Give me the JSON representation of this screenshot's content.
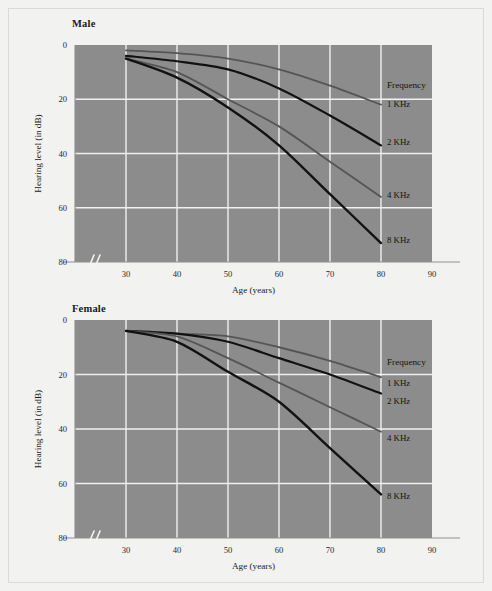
{
  "figure": {
    "background_color": "#f2f2f0",
    "plot_background_color": "#8c8c8c",
    "grid_color": "#f0f0ee"
  },
  "panels": [
    {
      "id": "male",
      "title": "Male",
      "legend_title": "Frequency",
      "xlabel": "Age (years)",
      "ylabel": "Hearing level (in dB)"
    },
    {
      "id": "female",
      "title": "Female",
      "legend_title": "Frequency",
      "xlabel": "Age (years)",
      "ylabel": "Hearing level (in dB)"
    }
  ],
  "axis": {
    "x_ticks": [
      "30",
      "40",
      "50",
      "60",
      "70",
      "80",
      "90"
    ],
    "y_ticks": [
      "0",
      "20",
      "40",
      "60",
      "80"
    ],
    "x_break_marker": "//"
  },
  "legend_labels": [
    "1 KHz",
    "2 KHz",
    "4 KHz",
    "8 KHz"
  ],
  "chart_data": [
    {
      "type": "line",
      "title": "Male",
      "xlabel": "Age (years)",
      "ylabel": "Hearing level (in dB)",
      "xlim": [
        20,
        90
      ],
      "ylim": [
        0,
        80
      ],
      "y_inverted": true,
      "xticks": [
        30,
        40,
        50,
        60,
        70,
        80,
        90
      ],
      "yticks": [
        0,
        20,
        40,
        60,
        80
      ],
      "grid": true,
      "legend_title": "Frequency",
      "legend_position": "right-outside",
      "x": [
        30,
        40,
        50,
        60,
        70,
        80
      ],
      "series": [
        {
          "name": "1 KHz",
          "color": "#555555",
          "width": 1.8,
          "values": [
            2,
            3,
            5,
            9,
            15,
            22
          ]
        },
        {
          "name": "2 KHz",
          "color": "#121212",
          "width": 2.2,
          "values": [
            4,
            6,
            9,
            16,
            26,
            37
          ]
        },
        {
          "name": "4 KHz",
          "color": "#555555",
          "width": 1.8,
          "values": [
            5,
            10,
            20,
            30,
            43,
            56
          ]
        },
        {
          "name": "8 KHz",
          "color": "#121212",
          "width": 2.4,
          "values": [
            5,
            12,
            23,
            37,
            55,
            73
          ]
        }
      ]
    },
    {
      "type": "line",
      "title": "Female",
      "xlabel": "Age (years)",
      "ylabel": "Hearing level (in dB)",
      "xlim": [
        20,
        90
      ],
      "ylim": [
        0,
        80
      ],
      "y_inverted": true,
      "xticks": [
        30,
        40,
        50,
        60,
        70,
        80,
        90
      ],
      "yticks": [
        0,
        20,
        40,
        60,
        80
      ],
      "grid": true,
      "legend_title": "Frequency",
      "legend_position": "right-outside",
      "x": [
        30,
        40,
        50,
        60,
        70,
        80
      ],
      "series": [
        {
          "name": "1 KHz",
          "color": "#555555",
          "width": 1.8,
          "values": [
            4,
            5,
            6,
            10,
            15,
            21
          ]
        },
        {
          "name": "2 KHz",
          "color": "#121212",
          "width": 2.2,
          "values": [
            4,
            5,
            8,
            14,
            20,
            27
          ]
        },
        {
          "name": "4 KHz",
          "color": "#555555",
          "width": 1.8,
          "values": [
            4,
            6,
            14,
            23,
            32,
            41
          ]
        },
        {
          "name": "8 KHz",
          "color": "#121212",
          "width": 2.4,
          "values": [
            4,
            8,
            19,
            30,
            47,
            64
          ]
        }
      ]
    }
  ]
}
